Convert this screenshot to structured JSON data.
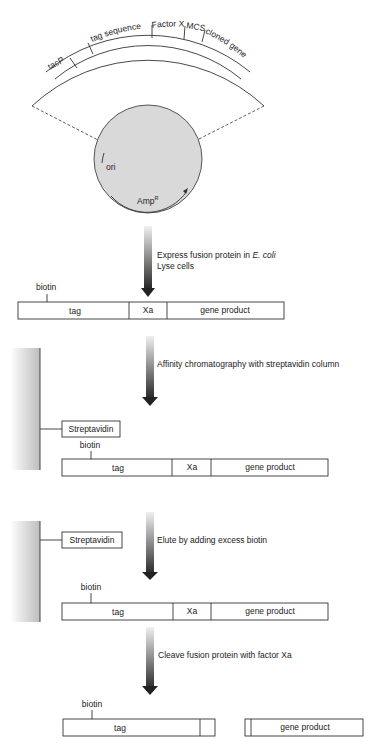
{
  "plasmid": {
    "segments": [
      "tacP",
      "",
      "tag sequence",
      "Factor Xa",
      "MCS",
      "cloned gene"
    ],
    "features": {
      "ori": "ori",
      "amp": "Amp",
      "amp_sup": "R"
    },
    "fill_color": "#d9d9d9"
  },
  "steps": [
    {
      "text_line1": "Express fusion protein in ",
      "text_italic": "E. coli",
      "text_line2": "Lyse cells"
    },
    {
      "text_line1": "Affinity chromatography with streptavidin column"
    },
    {
      "text_line1": "Elute by adding excess biotin"
    },
    {
      "text_line1": "Cleave fusion protein with factor Xa"
    }
  ],
  "fusion_protein": {
    "biotin": "biotin",
    "tag": "tag",
    "xa": "Xa",
    "gene_product": "gene product"
  },
  "column": {
    "streptavidin": "Streptavidin"
  }
}
